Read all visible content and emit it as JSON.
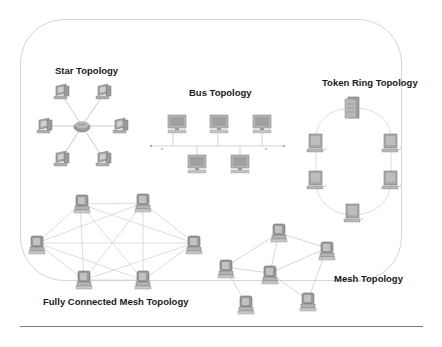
{
  "figure": {
    "titles": {
      "star": "Star Topology",
      "bus": "Bus Topology",
      "ring": "Token Ring Topology",
      "full_mesh": "Fully Connected Mesh Topology",
      "mesh": "Mesh Topology"
    },
    "colors": {
      "frame": "#d4d4d4",
      "link": "#c8c8c8",
      "device": "#8c8c8c",
      "device_light": "#b8b8b8",
      "title": "#1a1a1a",
      "rule": "#7a7a7a"
    },
    "topologies": [
      {
        "id": "star",
        "nodes": 6,
        "hub": "switch-icon"
      },
      {
        "id": "bus",
        "nodes": 5,
        "backbone": "bus-line"
      },
      {
        "id": "ring",
        "nodes": 5,
        "server": "server-icon"
      },
      {
        "id": "full_mesh",
        "nodes": 6
      },
      {
        "id": "mesh",
        "nodes": 6
      }
    ]
  }
}
